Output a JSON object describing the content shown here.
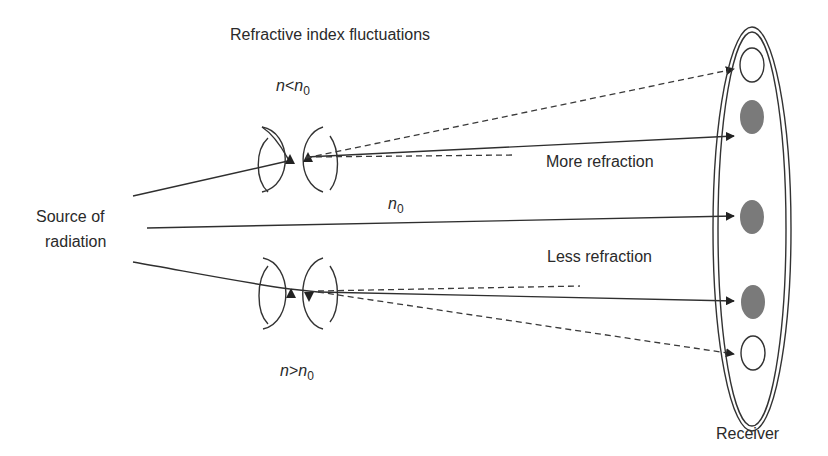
{
  "diagram": {
    "title": "Refractive index fluctuations",
    "source_label_line1": "Source of",
    "source_label_line2": "radiation",
    "upper_condition": {
      "symbol": "n",
      "relation": "<",
      "ref_symbol": "n",
      "ref_subscript": "0"
    },
    "lower_condition": {
      "symbol": "n",
      "relation": ">",
      "ref_symbol": "n",
      "ref_subscript": "0"
    },
    "center_label": {
      "symbol": "n",
      "subscript": "0"
    },
    "more_refraction_label": "More refraction",
    "less_refraction_label": "Less refraction",
    "receiver_label": "Receiver",
    "receiver_spots": [
      {
        "position": "top",
        "type": "empty",
        "ray": "dashed"
      },
      {
        "position": "upper",
        "type": "filled",
        "ray": "solid"
      },
      {
        "position": "center",
        "type": "filled",
        "ray": "solid"
      },
      {
        "position": "lower",
        "type": "filled",
        "ray": "solid"
      },
      {
        "position": "bottom",
        "type": "empty",
        "ray": "dashed"
      }
    ],
    "colors": {
      "line": "#2f2f2f",
      "spot_fill": "#7a7a7a",
      "background": "#ffffff"
    }
  }
}
